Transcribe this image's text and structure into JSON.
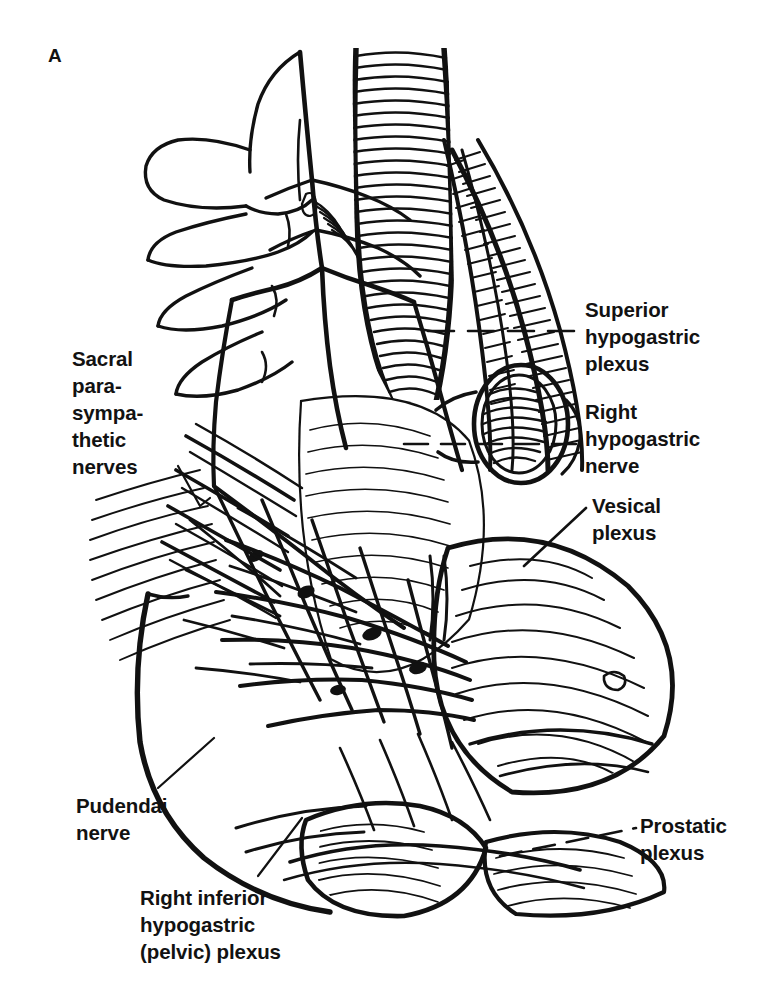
{
  "figure": {
    "panel_label": "A",
    "style": "black and white line engraving",
    "background_color": "#ffffff",
    "ink_color": "#111111"
  },
  "annotations": {
    "sacral_parasympathetic_nerves": "Sacral\npara-\nsympa-\nthetic\nnerves",
    "pudendal_nerve": "Pudendai\nnerve",
    "right_inferior_hypogastric_plexus": "Right inferior\nhypogastric\n(pelvic) plexus",
    "superior_hypogastric_plexus": "Superior\nhypogastric\nplexus",
    "right_hypogastric_nerve": "Right\nhypogastric\nnerve",
    "vesical_plexus": "Vesical\nplexus",
    "prostatic_plexus": "Prostatic\nplexus"
  },
  "leader_lines": [
    {
      "name": "leader-superior-hypogastric-plexus",
      "style": "dashed",
      "from_x": 430,
      "from_y": 331,
      "to_x": 578,
      "to_y": 331
    },
    {
      "name": "leader-right-hypogastric-nerve",
      "from_x": 418,
      "from_y": 440,
      "to_x": 578,
      "to_y": 432,
      "style": "dashed"
    },
    {
      "name": "leader-vesical-plexus",
      "style": "solid",
      "from_x": 520,
      "from_y": 560,
      "to_x": 586,
      "to_y": 506
    },
    {
      "name": "leader-prostatic-plexus",
      "style": "dashed",
      "from_x": 505,
      "from_y": 852,
      "to_x": 634,
      "to_y": 828
    },
    {
      "name": "leader-sacral-parasympathetic-nerves",
      "style": "solid",
      "from_x": 176,
      "from_y": 468,
      "to_x": 205,
      "to_y": 520
    },
    {
      "name": "leader-pudendal-nerve",
      "style": "solid",
      "from_x": 160,
      "from_y": 790,
      "to_x": 210,
      "to_y": 742
    },
    {
      "name": "leader-right-inferior-hypogastric-plexus",
      "style": "solid",
      "from_x": 258,
      "from_y": 878,
      "to_x": 300,
      "to_y": 820
    }
  ]
}
